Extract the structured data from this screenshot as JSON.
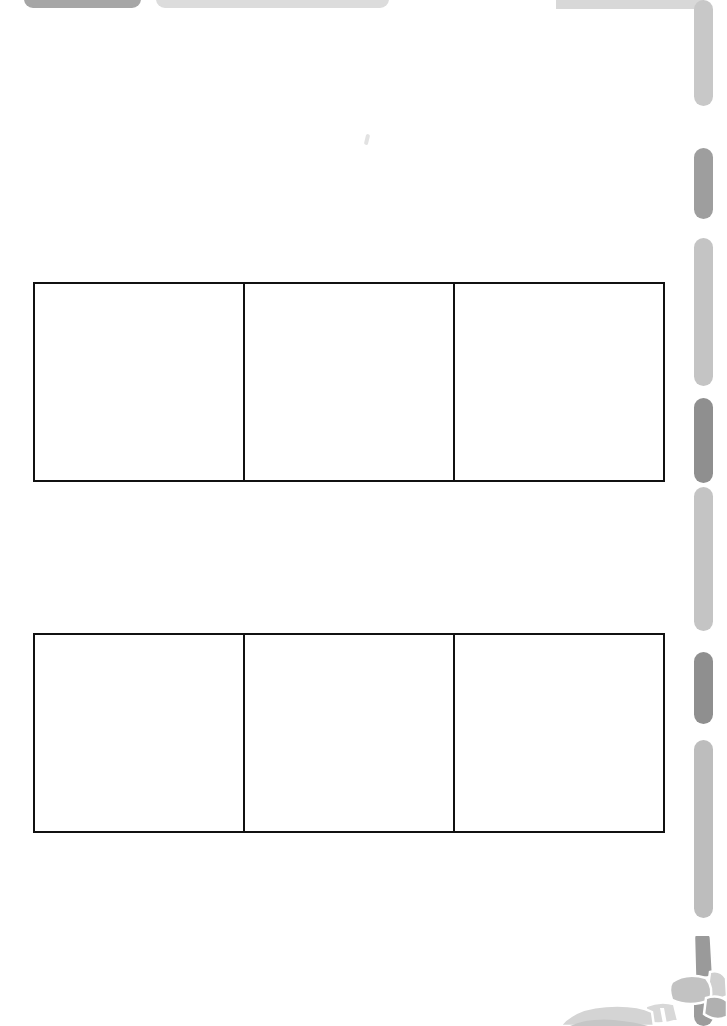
{
  "page": {
    "background_color": "#ffffff",
    "width": 727,
    "height": 1026
  },
  "top_tabs": [
    {
      "name": "tab-dark",
      "label": "",
      "color": "#a6a6a6",
      "x": 24,
      "width": 117
    },
    {
      "name": "tab-light",
      "label": "",
      "color": "#dcdcdc",
      "x": 156,
      "width": 233
    }
  ],
  "top_rail": {
    "color": "#d8d8d8",
    "x": 556,
    "width": 148,
    "height": 9
  },
  "margin_bars": [
    {
      "name": "margin-bar-1",
      "top": 0,
      "height": 106,
      "color": "#c8c8c8"
    },
    {
      "name": "margin-bar-2",
      "top": 148,
      "height": 71,
      "color": "#9e9e9e"
    },
    {
      "name": "margin-bar-3",
      "top": 238,
      "height": 148,
      "color": "#c4c4c4"
    },
    {
      "name": "margin-bar-4",
      "top": 398,
      "height": 85,
      "color": "#8f8f8f"
    },
    {
      "name": "margin-bar-5",
      "top": 487,
      "height": 144,
      "color": "#c4c4c4"
    },
    {
      "name": "margin-bar-6",
      "top": 652,
      "height": 72,
      "color": "#8f8f8f"
    },
    {
      "name": "margin-bar-7",
      "top": 740,
      "height": 178,
      "color": "#bdbdbd"
    },
    {
      "name": "margin-bar-8",
      "top": 948,
      "height": 78,
      "color": "#9c9c9c"
    }
  ],
  "tables": [
    {
      "name": "table-top",
      "rows": 1,
      "columns": 3,
      "border_color": "#111111",
      "cells": [
        [
          "",
          "",
          ""
        ]
      ]
    },
    {
      "name": "table-bottom",
      "rows": 1,
      "columns": 3,
      "border_color": "#111111",
      "cells": [
        [
          "",
          "",
          ""
        ]
      ]
    }
  ],
  "illustration": {
    "name": "character-illustration-fragment",
    "description": "grayscale cartoon illustration partially cropped at bottom-right corner",
    "colors": {
      "light": "#d6d6d6",
      "mid": "#b3b3b3",
      "dark": "#8c8c8c",
      "outline": "#ffffff"
    }
  },
  "artifact": {
    "name": "stray-mark",
    "color": "#e2e2e2"
  }
}
